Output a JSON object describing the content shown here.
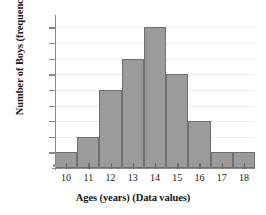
{
  "chart_data": {
    "type": "bar",
    "title": "",
    "xlabel": "Ages (years) (Data values)",
    "ylabel": "Number of Boys (frequency)",
    "categories": [
      "10",
      "11",
      "12",
      "13",
      "14",
      "15",
      "16",
      "17",
      "18"
    ],
    "values": [
      1,
      2,
      5,
      7,
      9,
      6,
      3,
      1,
      1
    ],
    "xtick_labels": [
      "10",
      "11",
      "12",
      "13",
      "14",
      "15",
      "16",
      "17",
      "18"
    ],
    "ytick_labels": [
      "1",
      "2",
      "3",
      "4",
      "5",
      "6",
      "7",
      "8",
      "9"
    ],
    "ylim": [
      0,
      9.6
    ],
    "xlim": [
      9.5,
      18.5
    ],
    "grid": true,
    "grid_axis": "y",
    "legend": false,
    "legend_position": "none",
    "bar_color": "#9b9b9b",
    "bar_edge_color": "#6f6f6f",
    "grid_color": "#ececec",
    "axis_color": "#8a8a8a",
    "text_color": "#1a1a1a",
    "background_color": "#ffffff",
    "bins": [
      {
        "label": "10",
        "lower": 9.5,
        "upper": 10.5,
        "frequency": 1
      },
      {
        "label": "11",
        "lower": 10.5,
        "upper": 11.5,
        "frequency": 2
      },
      {
        "label": "12",
        "lower": 11.5,
        "upper": 12.5,
        "frequency": 5
      },
      {
        "label": "13",
        "lower": 12.5,
        "upper": 13.5,
        "frequency": 7
      },
      {
        "label": "14",
        "lower": 13.5,
        "upper": 14.5,
        "frequency": 9
      },
      {
        "label": "15",
        "lower": 14.5,
        "upper": 15.5,
        "frequency": 6
      },
      {
        "label": "16",
        "lower": 15.5,
        "upper": 16.5,
        "frequency": 3
      },
      {
        "label": "17",
        "lower": 16.5,
        "upper": 17.5,
        "frequency": 1
      },
      {
        "label": "18",
        "lower": 17.5,
        "upper": 18.5,
        "frequency": 1
      }
    ]
  }
}
